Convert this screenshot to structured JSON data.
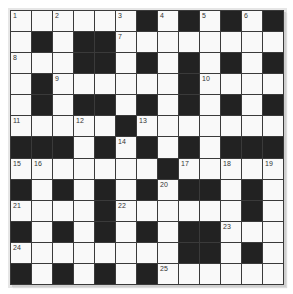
{
  "puzzle": {
    "rows": 13,
    "cols": 13,
    "colors": {
      "black": "#222222",
      "white": "#f9f9f9",
      "line": "#3a3a3a"
    },
    "layout": [
      "WWWWWWBWBWBWB",
      "WBWBBWWWWWWWW",
      "WWWBBWBWBWBWB",
      "WBWWWWWWBWWWW",
      "WBWBBWBWBWBWB",
      "WWWWWBWWWWWWW",
      "BBBWBWBWBWBBB",
      "WWWWWWWBWWWWW",
      "BWBWBWBWBBWBW",
      "WWWWBWWWWWWBW",
      "BWBWBWBWBBWWW",
      "WWWWWWWWBBWBW",
      "BWBWBWBWWWWWW"
    ],
    "numbers": [
      {
        "r": 0,
        "c": 0,
        "n": "1"
      },
      {
        "r": 0,
        "c": 2,
        "n": "2"
      },
      {
        "r": 0,
        "c": 5,
        "n": "3"
      },
      {
        "r": 0,
        "c": 7,
        "n": "4"
      },
      {
        "r": 0,
        "c": 9,
        "n": "5"
      },
      {
        "r": 0,
        "c": 11,
        "n": "6"
      },
      {
        "r": 1,
        "c": 5,
        "n": "7"
      },
      {
        "r": 2,
        "c": 0,
        "n": "8"
      },
      {
        "r": 3,
        "c": 2,
        "n": "9"
      },
      {
        "r": 3,
        "c": 9,
        "n": "10"
      },
      {
        "r": 5,
        "c": 0,
        "n": "11"
      },
      {
        "r": 5,
        "c": 3,
        "n": "12"
      },
      {
        "r": 5,
        "c": 6,
        "n": "13"
      },
      {
        "r": 6,
        "c": 5,
        "n": "14"
      },
      {
        "r": 7,
        "c": 0,
        "n": "15"
      },
      {
        "r": 7,
        "c": 1,
        "n": "16"
      },
      {
        "r": 7,
        "c": 8,
        "n": "17"
      },
      {
        "r": 7,
        "c": 10,
        "n": "18"
      },
      {
        "r": 7,
        "c": 12,
        "n": "19"
      },
      {
        "r": 8,
        "c": 7,
        "n": "20"
      },
      {
        "r": 9,
        "c": 0,
        "n": "21"
      },
      {
        "r": 9,
        "c": 5,
        "n": "22"
      },
      {
        "r": 10,
        "c": 10,
        "n": "23"
      },
      {
        "r": 11,
        "c": 0,
        "n": "24"
      },
      {
        "r": 12,
        "c": 7,
        "n": "25"
      }
    ]
  }
}
